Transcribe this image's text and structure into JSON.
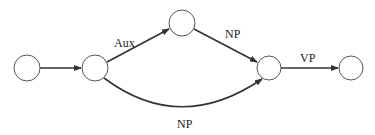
{
  "diagram": {
    "type": "finite-state-network",
    "nodes": [
      {
        "id": "n1",
        "cx": 27,
        "cy": 68,
        "r": 13
      },
      {
        "id": "n2",
        "cx": 95,
        "cy": 68,
        "r": 13
      },
      {
        "id": "n3",
        "cx": 182,
        "cy": 23,
        "r": 13
      },
      {
        "id": "n4",
        "cx": 269,
        "cy": 68,
        "r": 12
      },
      {
        "id": "n5",
        "cx": 351,
        "cy": 68,
        "r": 12
      }
    ],
    "edges": [
      {
        "from": "n1",
        "to": "n2",
        "label": ""
      },
      {
        "from": "n2",
        "to": "n3",
        "label": "Aux"
      },
      {
        "from": "n3",
        "to": "n4",
        "label": "NP"
      },
      {
        "from": "n2",
        "to": "n4",
        "label": "NP"
      },
      {
        "from": "n4",
        "to": "n5",
        "label": "VP"
      }
    ],
    "labels": {
      "aux": "Aux",
      "np_upper": "NP",
      "np_lower": "NP",
      "vp": "VP"
    }
  }
}
